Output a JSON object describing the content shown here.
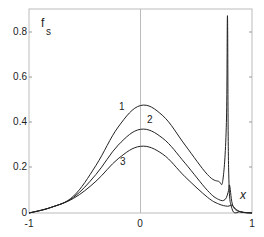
{
  "chart_data": {
    "type": "line",
    "title": "",
    "xlabel": "x",
    "ylabel": "f_s",
    "xlim": [
      -1,
      1
    ],
    "ylim": [
      0,
      0.9
    ],
    "grid": false,
    "legend": "inline curve labels 1, 2, 3",
    "x_ticks": [
      "-1",
      "0",
      "1"
    ],
    "y_ticks": [
      "0",
      "0.2",
      "0.4",
      "0.6",
      "0.8"
    ],
    "series": [
      {
        "name": "1",
        "x": [
          -1,
          -0.8,
          -0.6,
          -0.4,
          -0.2,
          0,
          0.2,
          0.4,
          0.6,
          0.7,
          0.74,
          0.77,
          0.78,
          0.79,
          0.82,
          0.9,
          1
        ],
        "y": [
          0,
          0.025,
          0.075,
          0.21,
          0.38,
          0.475,
          0.43,
          0.3,
          0.17,
          0.14,
          0.15,
          0.4,
          0.87,
          0.2,
          0.02,
          0.005,
          0
        ]
      },
      {
        "name": "2",
        "x": [
          -1,
          -0.8,
          -0.6,
          -0.4,
          -0.2,
          0,
          0.2,
          0.4,
          0.6,
          0.7,
          0.76,
          0.79,
          0.8,
          0.83,
          0.9,
          1
        ],
        "y": [
          0,
          0.025,
          0.07,
          0.17,
          0.3,
          0.37,
          0.33,
          0.22,
          0.1,
          0.06,
          0.06,
          0.1,
          0.12,
          0.03,
          0.005,
          0
        ]
      },
      {
        "name": "3",
        "x": [
          -1,
          -0.8,
          -0.6,
          -0.4,
          -0.2,
          0,
          0.2,
          0.4,
          0.6,
          0.7,
          0.78,
          0.82,
          0.85,
          0.9,
          1
        ],
        "y": [
          0,
          0.025,
          0.065,
          0.14,
          0.24,
          0.295,
          0.26,
          0.16,
          0.07,
          0.04,
          0.03,
          0.035,
          0.02,
          0.005,
          0
        ]
      }
    ],
    "annotations": [
      "1",
      "2",
      "3",
      "x",
      "f_s"
    ]
  },
  "labels": {
    "ylabel_main": "f",
    "ylabel_sub": "s",
    "xlabel": "x",
    "curve1": "1",
    "curve2": "2",
    "curve3": "3",
    "xtick_neg1": "-1",
    "xtick_0": "0",
    "xtick_1": "1",
    "ytick_0": "0",
    "ytick_02": "0.2",
    "ytick_04": "0.4",
    "ytick_06": "0.6",
    "ytick_08": "0.8"
  }
}
